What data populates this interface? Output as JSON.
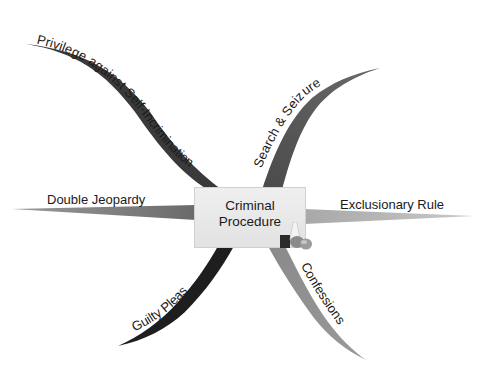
{
  "diagram": {
    "type": "mind-map",
    "central_topic": {
      "line1": "Criminal",
      "line2": "Procedure",
      "icon": "legal-objects-icon"
    },
    "branches": [
      {
        "id": "privilege",
        "label": "Privilege against Self-Incrimination",
        "position": "top-left",
        "color": "#3a3a3a"
      },
      {
        "id": "search",
        "label": "Search & Seizure",
        "position": "top-right",
        "color": "#555555"
      },
      {
        "id": "double",
        "label": "Double Jeopardy",
        "position": "left",
        "color": "#7a7a7a"
      },
      {
        "id": "exclusionary",
        "label": "Exclusionary Rule",
        "position": "right",
        "color": "#a0a0a0"
      },
      {
        "id": "guilty",
        "label": "Guilty Pleas",
        "position": "bottom-left",
        "color": "#1e1e1e"
      },
      {
        "id": "confessions",
        "label": "Confessions",
        "position": "bottom-right",
        "color": "#8a8a8a"
      }
    ]
  }
}
